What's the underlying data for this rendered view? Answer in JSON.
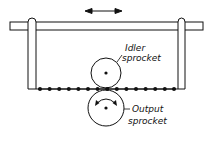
{
  "diagram": {
    "labels": {
      "idler_line1": "Idler",
      "idler_line2": "sprocket",
      "output_line1": "Output",
      "output_line2": "sprocket"
    },
    "motion_indicator": "double-headed-arrow",
    "chain_link_count": 15,
    "colors": {
      "ink": "#111111",
      "background": "#ffffff"
    }
  }
}
